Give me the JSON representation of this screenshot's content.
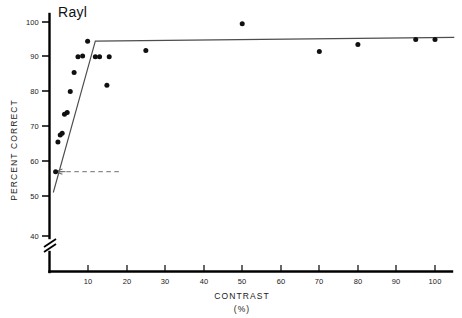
{
  "figure": {
    "panel_label": "Rayl",
    "background_color": "#ffffff",
    "marker_color": "#101010",
    "fit_line_color": "#4d4d4d",
    "threshold_line_color": "#8a8a8a"
  },
  "chart_data": {
    "type": "scatter",
    "title": "Rayl",
    "xlabel": "CONTRAST",
    "xlabel_units": "(%)",
    "ylabel": "PERCENT  CORRECT",
    "xlim": [
      0,
      105
    ],
    "ylim": [
      40,
      100
    ],
    "grid": false,
    "legend": false,
    "y_axis_break": {
      "present": true,
      "between": [
        40,
        50
      ],
      "note": "slanted double-slash break on vertical axis below the 50 tick"
    },
    "xticks": [
      10,
      20,
      30,
      40,
      50,
      60,
      70,
      80,
      90,
      100
    ],
    "xticklabels": [
      "10",
      "20",
      "30",
      "40",
      "50",
      "60",
      "70",
      "80",
      "90",
      "100"
    ],
    "yticks": [
      40,
      50,
      60,
      70,
      80,
      90,
      100
    ],
    "yticklabels": [
      "40",
      "50",
      "60",
      "70",
      "80",
      "90",
      "100"
    ],
    "series": [
      {
        "name": "observer Rayl data",
        "type": "scatter",
        "marker": "filled-circle",
        "x": [
          1.6,
          2.2,
          2.8,
          3.3,
          3.9,
          4.6,
          5.4,
          6.4,
          7.4,
          8.6,
          9.9,
          11.9,
          13.0,
          14.9,
          15.5,
          25.0,
          50.0,
          70.0,
          80.0,
          95.0,
          100.0
        ],
        "y": [
          57.0,
          65.5,
          67.5,
          68.0,
          73.5,
          74.0,
          80.0,
          85.5,
          90.0,
          90.2,
          94.5,
          90.0,
          90.0,
          81.8,
          90.0,
          91.8,
          99.5,
          91.5,
          93.5,
          95.0,
          95.0
        ]
      },
      {
        "name": "two-limb fitted function",
        "type": "line",
        "x": [
          1.0,
          11.9,
          105.0
        ],
        "y": [
          51.0,
          94.5,
          95.6
        ]
      }
    ],
    "annotations": [
      {
        "name": "threshold-indicator",
        "type": "dashed-horizontal-line-with-left-arrow",
        "y": 57.0,
        "x_start": 0.0,
        "x_end": 18.0,
        "label": ""
      }
    ]
  },
  "axes": {
    "y_title": "PERCENT  CORRECT",
    "x_title": "CONTRAST",
    "x_units": "(%)"
  }
}
